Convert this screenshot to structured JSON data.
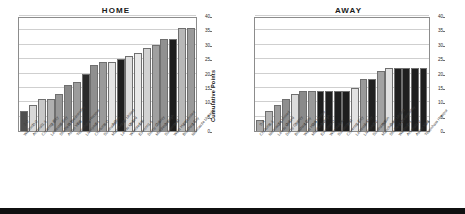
{
  "chart_data": [
    {
      "type": "bar",
      "title": "HOME",
      "ylabel": "Cumulative Points",
      "xlabel": "",
      "ylim": [
        0,
        40
      ],
      "yticks": [
        0,
        5,
        10,
        15,
        20,
        25,
        30,
        35,
        40
      ],
      "grid": true,
      "legend": "none",
      "categories": [
        "Watford",
        "Arsenal",
        "Coventry City",
        "Leicester City",
        "Sheffield Wednesday",
        "Aston Villa",
        "Tottenham Hotspur",
        "Liverpool",
        "Chelsea",
        "Southampton",
        "Manchester United",
        "Leeds United",
        "Wimbledon",
        "Everton",
        "Derby County",
        "Middlesbrough",
        "Sunderland",
        "West Ham United",
        "Bradford City",
        "Newcastle United"
      ],
      "scores": [
        "2-0",
        "0-0",
        "1-1",
        "2-0",
        "1-0",
        "0-1",
        "4-0",
        "0-2",
        "4-1",
        "3-0",
        "2-0",
        "1-3",
        "2-3",
        "1-1",
        "1-1",
        "2-1",
        "2-1",
        "0-1",
        "1-0",
        "3-1"
      ],
      "values": [
        7,
        9,
        11,
        11,
        13,
        16,
        17,
        20,
        23,
        24,
        24,
        25,
        26,
        27,
        29,
        30,
        32,
        32,
        36,
        36
      ],
      "bar_shades": [
        "#4f4f4f",
        "#d8d8d8",
        "#c8c8c8",
        "#b0b0b0",
        "#989898",
        "#8a8a8a",
        "#9c9c9c",
        "#2a2a2a",
        "#8f8f8f",
        "#9a9a9a",
        "#e4e4e4",
        "#1f1f1f",
        "#dedede",
        "#e8e8e8",
        "#d2d2d2",
        "#a0a0a0",
        "#909090",
        "#1c1c1c",
        "#b8b8b8",
        "#9a9a9a"
      ]
    },
    {
      "type": "bar",
      "title": "AWAY",
      "ylabel": "Cumulative Points",
      "xlabel": "",
      "ylim": [
        0,
        40
      ],
      "yticks": [
        0,
        5,
        10,
        15,
        20,
        25,
        30,
        35,
        40
      ],
      "grid": true,
      "legend": "none",
      "categories": [
        "Chelsea",
        "Newcastle United",
        "Leeds United",
        "Derby County",
        "Bradford City",
        "West Ham United",
        "Middlesbrough",
        "Everton",
        "Wimbledon",
        "Sunderland",
        "Coventry City",
        "Leicester City",
        "Liverpool",
        "Southampton",
        "Manchester United",
        "Sheffield Wednesday",
        "Watford",
        "Arsenal",
        "Aston Villa",
        "Tottenham Hotspur"
      ],
      "scores": [
        "0-4",
        "3-1",
        "2-1",
        "3-1",
        "0-1",
        "4-2",
        "0-1",
        "3-2",
        "4-0",
        "1-4",
        "3-1",
        "1-2",
        "1-1",
        "2-2",
        "0-1",
        "2-1",
        "2-2",
        "0-1",
        "1-2",
        "1-3"
      ],
      "values": [
        4,
        7,
        9,
        11,
        13,
        14,
        14,
        14,
        14,
        14,
        14,
        15,
        18,
        18,
        21,
        22,
        22,
        22,
        22,
        22
      ],
      "bar_shades": [
        "#a8a8a8",
        "#b4b4b4",
        "#9c9c9c",
        "#8e8e8e",
        "#dcdcdc",
        "#8a8a8a",
        "#9a9a9a",
        "#1e1e1e",
        "#1e1e1e",
        "#1e1e1e",
        "#1e1e1e",
        "#e2e2e2",
        "#9a9a9a",
        "#1f1f1f",
        "#a2a2a2",
        "#e0e0e0",
        "#1f1f1f",
        "#1f1f1f",
        "#1f1f1f",
        "#1f1f1f"
      ]
    }
  ],
  "colors": {
    "axis": "#8c8c8c",
    "grid": "#cfcfcf",
    "title": "#1a1a1a",
    "tick_text": "#2b2b2b",
    "footer": "#101010"
  }
}
